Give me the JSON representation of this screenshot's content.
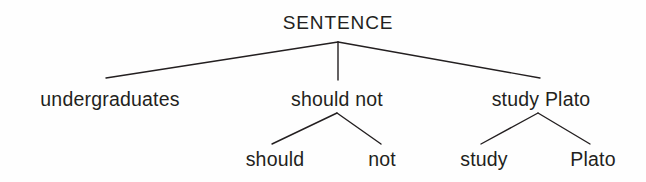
{
  "figure": {
    "type": "constituency-syntax-tree",
    "title": "SENTENCE",
    "background_color": "#fefefe",
    "line_color": "#231f20",
    "text_color": "#231f20",
    "width": 646,
    "height": 182
  },
  "nodes": {
    "root": {
      "label": "SENTENCE",
      "x": 338,
      "y": 28,
      "level": 0
    },
    "subject": {
      "label": "undergraduates",
      "x": 110,
      "y": 105,
      "level": 1
    },
    "negation": {
      "label": "should not",
      "x": 337,
      "y": 105,
      "level": 1
    },
    "predicate": {
      "label": "study Plato",
      "x": 541,
      "y": 105,
      "level": 1
    },
    "should": {
      "label": "should",
      "x": 275,
      "y": 165,
      "level": 2
    },
    "not": {
      "label": "not",
      "x": 382,
      "y": 165,
      "level": 2
    },
    "study": {
      "label": "study",
      "x": 484,
      "y": 165,
      "level": 2
    },
    "plato": {
      "label": "Plato",
      "x": 593,
      "y": 165,
      "level": 2
    }
  },
  "edges": [
    {
      "name": "root-to-subject",
      "from": "root",
      "to": "subject",
      "x1": 338,
      "y1": 42,
      "x2": 106,
      "y2": 78
    },
    {
      "name": "root-to-negation",
      "from": "root",
      "to": "negation",
      "x1": 338,
      "y1": 42,
      "x2": 338,
      "y2": 80
    },
    {
      "name": "root-to-predicate",
      "from": "root",
      "to": "predicate",
      "x1": 338,
      "y1": 42,
      "x2": 540,
      "y2": 78
    },
    {
      "name": "negation-to-should",
      "from": "negation",
      "to": "should",
      "x1": 337,
      "y1": 113,
      "x2": 272,
      "y2": 144
    },
    {
      "name": "negation-to-not",
      "from": "negation",
      "to": "not",
      "x1": 337,
      "y1": 113,
      "x2": 381,
      "y2": 144
    },
    {
      "name": "predicate-to-study",
      "from": "predicate",
      "to": "study",
      "x1": 538,
      "y1": 113,
      "x2": 481,
      "y2": 144
    },
    {
      "name": "predicate-to-plato",
      "from": "predicate",
      "to": "plato",
      "x1": 538,
      "y1": 113,
      "x2": 590,
      "y2": 144
    }
  ]
}
